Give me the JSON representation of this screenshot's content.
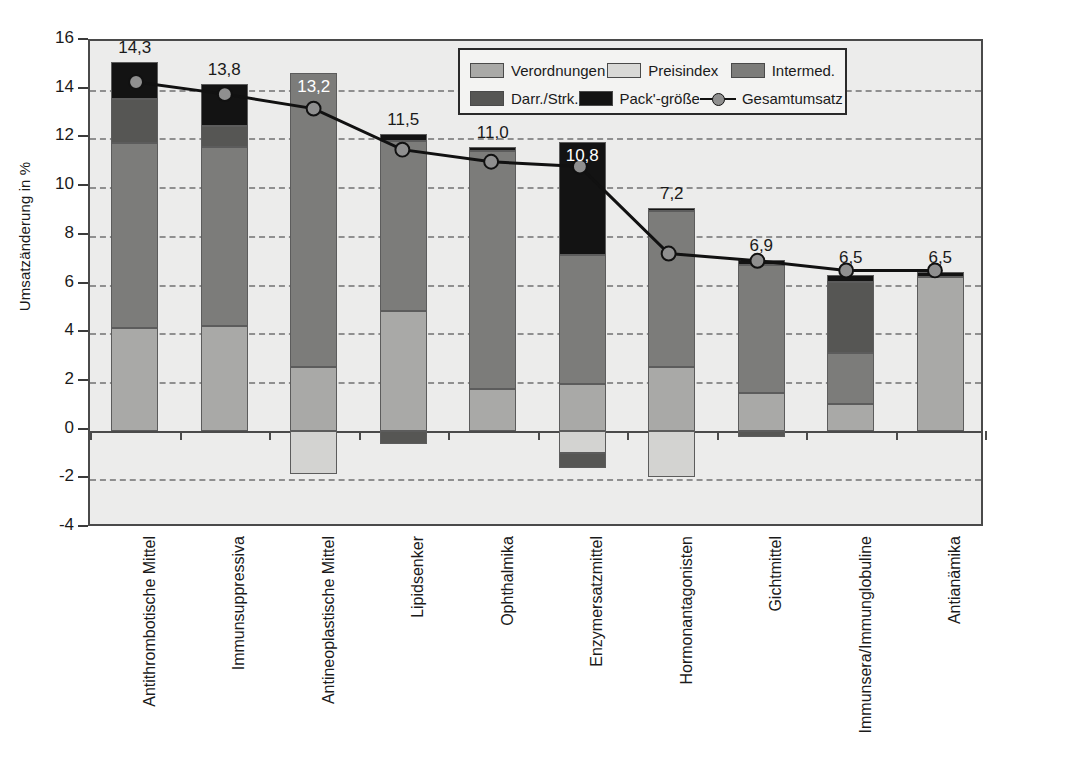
{
  "chart_data": {
    "type": "bar",
    "stacked": true,
    "title": "",
    "xlabel": "",
    "ylabel": "Umsatzänderung in %",
    "ylim": [
      -4,
      16
    ],
    "yticks": [
      -4,
      -2,
      0,
      2,
      4,
      6,
      8,
      10,
      12,
      14,
      16
    ],
    "ytick_labels": [
      "-4",
      "-2",
      "0",
      "2",
      "4",
      "6",
      "8",
      "10",
      "12",
      "14",
      "16"
    ],
    "grid": "horizontal-dashed",
    "legend_position": "top-center-inside",
    "categories": [
      "Antithrombotische Mittel",
      "Immunsuppressiva",
      "Antineoplastische Mittel",
      "Lipidsenker",
      "Ophthalmika",
      "Enzymersatzmittel",
      "Hormonantagonisten",
      "Gichtmittel",
      "Immunsera/Immunglobuline",
      "Antianämika"
    ],
    "series": [
      {
        "name": "Verordnungen",
        "color": "#a9a9a7",
        "values": [
          4.2,
          4.3,
          2.6,
          4.9,
          1.7,
          1.9,
          2.6,
          1.55,
          1.1,
          6.3
        ]
      },
      {
        "name": "Preisindex",
        "color": "#d3d3d1",
        "values": [
          0,
          0,
          -1.8,
          0,
          0,
          -0.9,
          -1.9,
          0,
          0,
          0
        ]
      },
      {
        "name": "Intermed.",
        "color": "#7c7c7a",
        "values": [
          7.6,
          7.35,
          12.1,
          7.0,
          9.8,
          5.3,
          6.4,
          5.25,
          2.1,
          0
        ]
      },
      {
        "name": "Darr./Strk.",
        "color": "#565654",
        "values": [
          1.8,
          0.85,
          0,
          -0.55,
          0,
          -0.65,
          0,
          -0.25,
          2.9,
          0
        ]
      },
      {
        "name": "Pack'-größe",
        "color": "#131313",
        "values": [
          1.55,
          1.75,
          0,
          0.3,
          0.15,
          4.65,
          0.15,
          0.2,
          0.3,
          0.2
        ]
      }
    ],
    "line_series": {
      "name": "Gesamtumsatz",
      "color": "#111111",
      "marker_fill": "#8f8f8f",
      "values": [
        14.3,
        13.8,
        13.2,
        11.5,
        11.0,
        10.8,
        7.2,
        6.9,
        6.5,
        6.5
      ],
      "labels": [
        "14,3",
        "13,8",
        "13,2",
        "11,5",
        "11,0",
        "10,8",
        "7,2",
        "6,9",
        "6,5",
        "6,5"
      ]
    }
  },
  "legend": {
    "items": [
      {
        "label": "Verordnungen",
        "swatch": "verordnungen"
      },
      {
        "label": "Preisindex",
        "swatch": "preisindex"
      },
      {
        "label": "Intermed.",
        "swatch": "intermed"
      },
      {
        "label": "Darr./Strk.",
        "swatch": "darr"
      },
      {
        "label": "Pack'-größe",
        "swatch": "pack"
      },
      {
        "label": "Gesamtumsatz",
        "swatch": "line"
      }
    ]
  }
}
